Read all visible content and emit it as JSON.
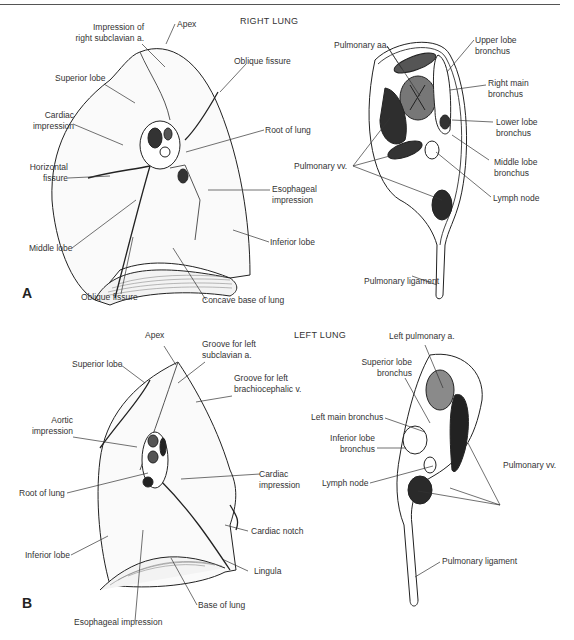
{
  "figure": {
    "panels": [
      {
        "letter": "A",
        "title": "RIGHT LUNG",
        "lung_labels": {
          "impression_subclavian_1": "Impression of",
          "impression_subclavian_2": "right subclavian a.",
          "apex": "Apex",
          "oblique_fissure_top": "Oblique fissure",
          "superior_lobe": "Superior lobe",
          "cardiac_impression_1": "Cardiac",
          "cardiac_impression_2": "impression",
          "root_of_lung": "Root of lung",
          "horizontal_fissure_1": "Horizontal",
          "horizontal_fissure_2": "fissure",
          "esophageal_impression_1": "Esophageal",
          "esophageal_impression_2": "impression",
          "middle_lobe": "Middle lobe",
          "inferior_lobe": "Inferior lobe",
          "oblique_fissure_bottom": "Oblique fissure",
          "concave_base": "Concave base of lung"
        },
        "root_labels": {
          "pulmonary_aa": "Pulmonary aa.",
          "upper_lobe_bronchus_1": "Upper lobe",
          "upper_lobe_bronchus_2": "bronchus",
          "right_main_bronchus_1": "Right main",
          "right_main_bronchus_2": "bronchus",
          "lower_lobe_bronchus_1": "Lower lobe",
          "lower_lobe_bronchus_2": "bronchus",
          "pulmonary_vv": "Pulmonary vv.",
          "middle_lobe_bronchus_1": "Middle lobe",
          "middle_lobe_bronchus_2": "bronchus",
          "lymph_node": "Lymph node",
          "pulmonary_ligament": "Pulmonary ligament"
        }
      },
      {
        "letter": "B",
        "title": "LEFT LUNG",
        "lung_labels": {
          "apex": "Apex",
          "groove_subclavian_1": "Groove for left",
          "groove_subclavian_2": "subclavian a.",
          "superior_lobe": "Superior lobe",
          "groove_brachio_1": "Groove for left",
          "groove_brachio_2": "brachiocephalic v.",
          "aortic_impression_1": "Aortic",
          "aortic_impression_2": "impression",
          "cardiac_impression_1": "Cardiac",
          "cardiac_impression_2": "impression",
          "root_of_lung": "Root of lung",
          "cardiac_notch": "Cardiac notch",
          "inferior_lobe": "Inferior lobe",
          "lingula": "Lingula",
          "base_of_lung": "Base of lung",
          "esophageal_impression": "Esophageal impression"
        },
        "root_labels": {
          "left_pulmonary_a": "Left pulmonary a.",
          "superior_lobe_bronchus_1": "Superior lobe",
          "superior_lobe_bronchus_2": "bronchus",
          "left_main_bronchus": "Left main bronchus",
          "inferior_lobe_bronchus_1": "Inferior lobe",
          "inferior_lobe_bronchus_2": "bronchus",
          "lymph_node": "Lymph node",
          "pulmonary_vv": "Pulmonary vv.",
          "pulmonary_ligament": "Pulmonary ligament"
        }
      }
    ]
  }
}
